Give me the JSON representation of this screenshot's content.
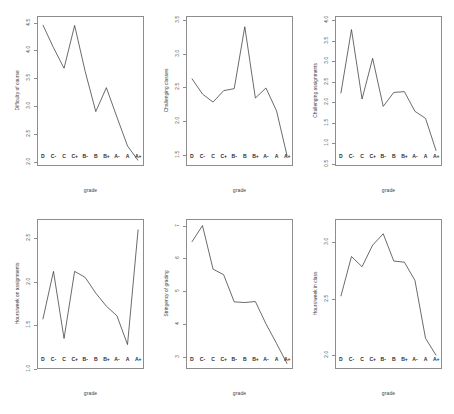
{
  "figure": {
    "title": "",
    "layout": "2 rows x 3 columns of line plots",
    "background_color": "#ffffff",
    "line_color": "#3a3a3a",
    "axis_color": "#8d8d8d",
    "grade_categories": [
      "D",
      "C-",
      "C",
      "C+",
      "B-",
      "B",
      "B+",
      "A-",
      "A",
      "A+"
    ]
  },
  "chart_data": [
    {
      "type": "line",
      "title": "",
      "xlabel": "grade",
      "ylabel": "Difficulty of course",
      "categories": [
        "D",
        "C-",
        "C",
        "C+",
        "B-",
        "B",
        "B+",
        "A-",
        "A",
        "A+"
      ],
      "values": [
        4.46,
        4.05,
        3.68,
        4.45,
        3.62,
        2.9,
        3.33,
        2.8,
        2.28,
        2.02
      ],
      "ylim": [
        1.92,
        4.62
      ],
      "yticks": [
        2.0,
        2.5,
        3.0,
        3.5,
        4.0,
        4.5
      ],
      "ytick_labels": [
        "2.0",
        "2.5",
        "3.0",
        "3.5",
        "4.0",
        "4.5"
      ],
      "grid": false,
      "legend": "none"
    },
    {
      "type": "line",
      "title": "",
      "xlabel": "grade",
      "ylabel": "Challenging classes",
      "categories": [
        "D",
        "C-",
        "C",
        "C+",
        "B-",
        "B",
        "B+",
        "A-",
        "A",
        "A+"
      ],
      "values": [
        2.63,
        2.4,
        2.28,
        2.45,
        2.48,
        3.4,
        2.34,
        2.49,
        2.15,
        1.48
      ],
      "ylim": [
        1.33,
        3.56
      ],
      "yticks": [
        1.5,
        2.0,
        2.5,
        3.0,
        3.5
      ],
      "ytick_labels": [
        "1.5",
        "2.0",
        "2.5",
        "3.0",
        "3.5"
      ],
      "grid": false,
      "legend": "none"
    },
    {
      "type": "line",
      "title": "",
      "xlabel": "grade",
      "ylabel": "Challenging assignments",
      "categories": [
        "D",
        "C-",
        "C",
        "C+",
        "B-",
        "B",
        "B+",
        "A-",
        "A",
        "A+"
      ],
      "values": [
        2.22,
        3.77,
        2.08,
        3.07,
        1.9,
        2.24,
        2.26,
        1.78,
        1.61,
        0.82
      ],
      "ylim": [
        0.45,
        4.1
      ],
      "yticks": [
        0.5,
        1.0,
        1.5,
        2.0,
        2.5,
        3.0,
        3.5,
        4.0
      ],
      "ytick_labels": [
        "0.5",
        "1.0",
        "1.5",
        "2.0",
        "2.5",
        "3.0",
        "3.5",
        "4.0"
      ],
      "grid": false,
      "legend": "none"
    },
    {
      "type": "line",
      "title": "",
      "xlabel": "grade",
      "ylabel": "Hours/week on assignments",
      "categories": [
        "D",
        "C-",
        "C",
        "C+",
        "B-",
        "B",
        "B+",
        "A-",
        "A",
        "A+"
      ],
      "values": [
        1.57,
        2.12,
        1.35,
        2.12,
        2.05,
        1.87,
        1.72,
        1.61,
        1.28,
        2.6
      ],
      "ylim": [
        1.0,
        2.72
      ],
      "yticks": [
        1.0,
        1.5,
        2.0,
        2.5
      ],
      "ytick_labels": [
        "1.0",
        "1.5",
        "2.0",
        "2.5"
      ],
      "grid": false,
      "legend": "none"
    },
    {
      "type": "line",
      "title": "",
      "xlabel": "grade",
      "ylabel": "Stringency of grading",
      "categories": [
        "D",
        "C-",
        "C",
        "C+",
        "B-",
        "B",
        "B+",
        "A-",
        "A",
        "A+"
      ],
      "values": [
        6.5,
        7.0,
        5.67,
        5.5,
        4.67,
        4.65,
        4.68,
        4.0,
        3.4,
        2.78
      ],
      "ylim": [
        2.62,
        7.2
      ],
      "yticks": [
        3,
        4,
        5,
        6,
        7
      ],
      "ytick_labels": [
        "3",
        "4",
        "5",
        "6",
        "7"
      ],
      "grid": false,
      "legend": "none"
    },
    {
      "type": "line",
      "title": "",
      "xlabel": "grade",
      "ylabel": "Hours/week in class",
      "categories": [
        "D",
        "C-",
        "C",
        "C+",
        "B-",
        "B",
        "B+",
        "A-",
        "A",
        "A+"
      ],
      "values": [
        2.52,
        2.87,
        2.78,
        2.97,
        3.07,
        2.83,
        2.82,
        2.66,
        2.15,
        2.0
      ],
      "ylim": [
        1.88,
        3.2
      ],
      "yticks": [
        2.0,
        2.5,
        3.0
      ],
      "ytick_labels": [
        "2.0",
        "2.5",
        "3.0"
      ],
      "grid": false,
      "legend": "none"
    }
  ]
}
